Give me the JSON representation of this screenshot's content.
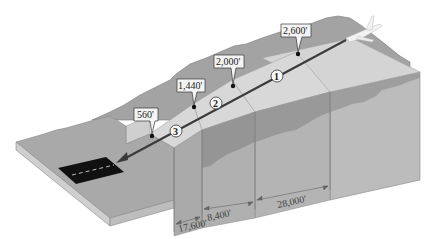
{
  "diagram": {
    "title": "",
    "colors": {
      "background": "#ffffff",
      "terrain_top": "#a8a8a8",
      "terrain_side_light": "#c9c9c9",
      "terrain_side_dark": "#9a9a9a",
      "step_top": "#d6d6d6",
      "step_front": "#bdbdbd",
      "runway": "#111111",
      "path_line": "#3a3a3a",
      "callout_fill": "#f4f4f4",
      "callout_border": "#333333"
    },
    "altitude_markers": [
      {
        "id": "alt-2600",
        "label": "2,600'"
      },
      {
        "id": "alt-2000",
        "label": "2,000'"
      },
      {
        "id": "alt-1440",
        "label": "1,440'"
      },
      {
        "id": "alt-560",
        "label": "560'"
      }
    ],
    "segments": [
      {
        "id": "seg-1",
        "label": "1"
      },
      {
        "id": "seg-2",
        "label": "2"
      },
      {
        "id": "seg-3",
        "label": "3"
      }
    ],
    "distances": [
      {
        "id": "dist-17600",
        "label": "17,600'"
      },
      {
        "id": "dist-8400",
        "label": "8,400'"
      },
      {
        "id": "dist-28000",
        "label": "28,000'"
      }
    ],
    "objects": {
      "aircraft": "airplane-icon",
      "runway": "runway"
    }
  }
}
